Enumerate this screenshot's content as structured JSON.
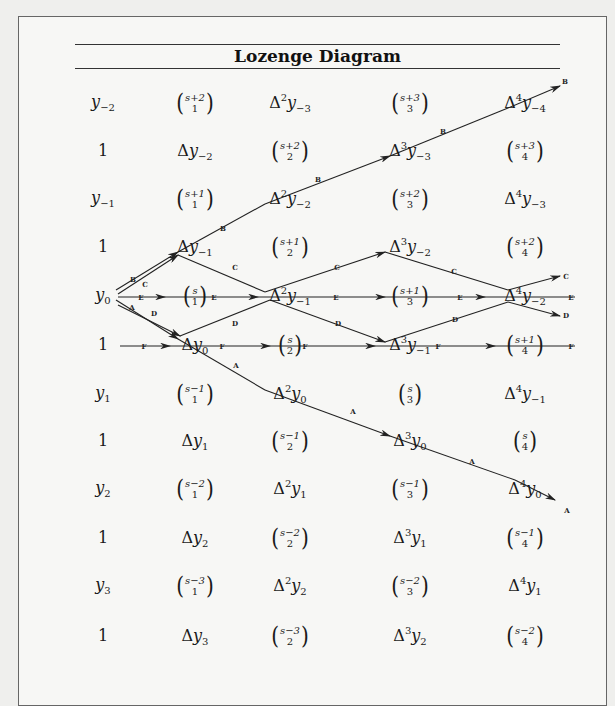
{
  "title": "Lozenge Diagram",
  "columns_x": [
    103,
    195,
    290,
    410,
    525
  ],
  "rows_y": [
    103,
    151,
    199,
    247,
    296,
    345,
    394,
    441,
    489,
    538,
    586,
    636
  ],
  "grid": [
    [
      {
        "t": "y",
        "sub": "−2"
      },
      {
        "t": "binom",
        "top": "s+2",
        "bot": "1"
      },
      {
        "t": "Δy",
        "pow": "2",
        "sub": "−3"
      },
      {
        "t": "binom",
        "top": "s+3",
        "bot": "3"
      },
      {
        "t": "Δy",
        "pow": "4",
        "sub": "−4"
      }
    ],
    [
      {
        "t": "one",
        "v": "1"
      },
      {
        "t": "Δy",
        "pow": "",
        "sub": "−2"
      },
      {
        "t": "binom",
        "top": "s+2",
        "bot": "2"
      },
      {
        "t": "Δy",
        "pow": "3",
        "sub": "−3"
      },
      {
        "t": "binom",
        "top": "s+3",
        "bot": "4"
      }
    ],
    [
      {
        "t": "y",
        "sub": "−1"
      },
      {
        "t": "binom",
        "top": "s+1",
        "bot": "1"
      },
      {
        "t": "Δy",
        "pow": "2",
        "sub": "−2"
      },
      {
        "t": "binom",
        "top": "s+2",
        "bot": "3"
      },
      {
        "t": "Δy",
        "pow": "4",
        "sub": "−3"
      }
    ],
    [
      {
        "t": "one",
        "v": "1"
      },
      {
        "t": "Δy",
        "pow": "",
        "sub": "−1"
      },
      {
        "t": "binom",
        "top": "s+1",
        "bot": "2"
      },
      {
        "t": "Δy",
        "pow": "3",
        "sub": "−2"
      },
      {
        "t": "binom",
        "top": "s+2",
        "bot": "4"
      }
    ],
    [
      {
        "t": "y",
        "sub": "0"
      },
      {
        "t": "binom",
        "top": "s",
        "bot": "1"
      },
      {
        "t": "Δy",
        "pow": "2",
        "sub": "−1"
      },
      {
        "t": "binom",
        "top": "s+1",
        "bot": "3"
      },
      {
        "t": "Δy",
        "pow": "4",
        "sub": "−2"
      }
    ],
    [
      {
        "t": "one",
        "v": "1"
      },
      {
        "t": "Δy",
        "pow": "",
        "sub": "0"
      },
      {
        "t": "binom",
        "top": "s",
        "bot": "2"
      },
      {
        "t": "Δy",
        "pow": "3",
        "sub": "−1"
      },
      {
        "t": "binom",
        "top": "s+1",
        "bot": "4"
      }
    ],
    [
      {
        "t": "y",
        "sub": "1"
      },
      {
        "t": "binom",
        "top": "s−1",
        "bot": "1"
      },
      {
        "t": "Δy",
        "pow": "2",
        "sub": "0"
      },
      {
        "t": "binom",
        "top": "s",
        "bot": "3"
      },
      {
        "t": "Δy",
        "pow": "4",
        "sub": "−1"
      }
    ],
    [
      {
        "t": "one",
        "v": "1"
      },
      {
        "t": "Δy",
        "pow": "",
        "sub": "1"
      },
      {
        "t": "binom",
        "top": "s−1",
        "bot": "2"
      },
      {
        "t": "Δy",
        "pow": "3",
        "sub": "0"
      },
      {
        "t": "binom",
        "top": "s",
        "bot": "4"
      }
    ],
    [
      {
        "t": "y",
        "sub": "2"
      },
      {
        "t": "binom",
        "top": "s−2",
        "bot": "1"
      },
      {
        "t": "Δy",
        "pow": "2",
        "sub": "1"
      },
      {
        "t": "binom",
        "top": "s−1",
        "bot": "3"
      },
      {
        "t": "Δy",
        "pow": "4",
        "sub": "0"
      }
    ],
    [
      {
        "t": "one",
        "v": "1"
      },
      {
        "t": "Δy",
        "pow": "",
        "sub": "2"
      },
      {
        "t": "binom",
        "top": "s−2",
        "bot": "2"
      },
      {
        "t": "Δy",
        "pow": "3",
        "sub": "1"
      },
      {
        "t": "binom",
        "top": "s−1",
        "bot": "4"
      }
    ],
    [
      {
        "t": "y",
        "sub": "3"
      },
      {
        "t": "binom",
        "top": "s−3",
        "bot": "1"
      },
      {
        "t": "Δy",
        "pow": "2",
        "sub": "2"
      },
      {
        "t": "binom",
        "top": "s−2",
        "bot": "3"
      },
      {
        "t": "Δy",
        "pow": "4",
        "sub": "1"
      }
    ],
    [
      {
        "t": "one",
        "v": "1"
      },
      {
        "t": "Δy",
        "pow": "",
        "sub": "3"
      },
      {
        "t": "binom",
        "top": "s−3",
        "bot": "2"
      },
      {
        "t": "Δy",
        "pow": "3",
        "sub": "2"
      },
      {
        "t": "binom",
        "top": "s−2",
        "bot": "4"
      }
    ]
  ],
  "paths": [
    {
      "name": "A",
      "points": [
        [
          116,
          300
        ],
        [
          178,
          339
        ],
        [
          265,
          390
        ],
        [
          390,
          436
        ],
        [
          515,
          480
        ],
        [
          555,
          500
        ]
      ]
    },
    {
      "name": "B",
      "points": [
        [
          116,
          290
        ],
        [
          178,
          252
        ],
        [
          265,
          204
        ],
        [
          390,
          156
        ],
        [
          508,
          108
        ],
        [
          560,
          86
        ]
      ]
    },
    {
      "name": "C",
      "points": [
        [
          118,
          294
        ],
        [
          178,
          255
        ],
        [
          265,
          292
        ],
        [
          385,
          252
        ],
        [
          508,
          290
        ],
        [
          560,
          276
        ]
      ]
    },
    {
      "name": "D",
      "points": [
        [
          118,
          305
        ],
        [
          180,
          336
        ],
        [
          270,
          300
        ],
        [
          385,
          342
        ],
        [
          508,
          302
        ],
        [
          560,
          316
        ]
      ]
    },
    {
      "name": "E",
      "points": [
        [
          118,
          297
        ],
        [
          165,
          297
        ],
        [
          225,
          297
        ],
        [
          258,
          297
        ],
        [
          330,
          297
        ],
        [
          385,
          297
        ],
        [
          440,
          297
        ],
        [
          485,
          297
        ],
        [
          575,
          297
        ]
      ]
    },
    {
      "name": "F",
      "points": [
        [
          120,
          346
        ],
        [
          170,
          346
        ],
        [
          225,
          346
        ],
        [
          270,
          346
        ],
        [
          330,
          346
        ],
        [
          375,
          346
        ],
        [
          445,
          346
        ],
        [
          495,
          346
        ],
        [
          575,
          346
        ]
      ]
    }
  ],
  "path_labels": [
    {
      "t": "B",
      "x": 133,
      "y": 282
    },
    {
      "t": "C",
      "x": 145,
      "y": 287
    },
    {
      "t": "A",
      "x": 132,
      "y": 310
    },
    {
      "t": "D",
      "x": 154,
      "y": 316
    },
    {
      "t": "E",
      "x": 141,
      "y": 300
    },
    {
      "t": "E",
      "x": 214,
      "y": 300
    },
    {
      "t": "E",
      "x": 336,
      "y": 300
    },
    {
      "t": "E",
      "x": 460,
      "y": 300
    },
    {
      "t": "E",
      "x": 571,
      "y": 300
    },
    {
      "t": "F",
      "x": 144,
      "y": 349
    },
    {
      "t": "F",
      "x": 222,
      "y": 349
    },
    {
      "t": "F",
      "x": 305,
      "y": 349
    },
    {
      "t": "F",
      "x": 438,
      "y": 349
    },
    {
      "t": "F",
      "x": 571,
      "y": 349
    },
    {
      "t": "B",
      "x": 223,
      "y": 231
    },
    {
      "t": "B",
      "x": 318,
      "y": 182
    },
    {
      "t": "B",
      "x": 443,
      "y": 134
    },
    {
      "t": "B",
      "x": 565,
      "y": 84
    },
    {
      "t": "C",
      "x": 235,
      "y": 270
    },
    {
      "t": "C",
      "x": 337,
      "y": 270
    },
    {
      "t": "C",
      "x": 454,
      "y": 274
    },
    {
      "t": "C",
      "x": 566,
      "y": 279
    },
    {
      "t": "D",
      "x": 235,
      "y": 326
    },
    {
      "t": "D",
      "x": 338,
      "y": 326
    },
    {
      "t": "D",
      "x": 455,
      "y": 322
    },
    {
      "t": "D",
      "x": 566,
      "y": 318
    },
    {
      "t": "A",
      "x": 236,
      "y": 368
    },
    {
      "t": "A",
      "x": 353,
      "y": 414
    },
    {
      "t": "A",
      "x": 472,
      "y": 464
    },
    {
      "t": "A",
      "x": 567,
      "y": 513
    }
  ]
}
